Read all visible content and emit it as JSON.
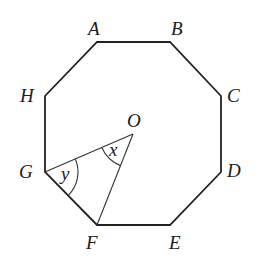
{
  "diagram": {
    "vertices": [
      {
        "name": "A",
        "label": "A",
        "x": 97,
        "y": 42,
        "lx": 88,
        "ly": 35
      },
      {
        "name": "B",
        "label": "B",
        "x": 170,
        "y": 42,
        "lx": 171,
        "ly": 35
      },
      {
        "name": "C",
        "label": "C",
        "x": 221,
        "y": 96,
        "lx": 227,
        "ly": 102
      },
      {
        "name": "D",
        "label": "D",
        "x": 221,
        "y": 172,
        "lx": 227,
        "ly": 177
      },
      {
        "name": "E",
        "label": "E",
        "x": 170,
        "y": 225,
        "lx": 169,
        "ly": 249
      },
      {
        "name": "F",
        "label": "F",
        "x": 97,
        "y": 225,
        "lx": 86,
        "ly": 249
      },
      {
        "name": "G",
        "label": "G",
        "x": 45,
        "y": 172,
        "lx": 19,
        "ly": 178
      },
      {
        "name": "H",
        "label": "H",
        "x": 45,
        "y": 96,
        "lx": 20,
        "ly": 102
      }
    ],
    "center": {
      "name": "O",
      "label": "O",
      "x": 133,
      "y": 134,
      "lx": 127,
      "ly": 127
    },
    "segments": [
      {
        "from": "G",
        "to": "O"
      },
      {
        "from": "O",
        "to": "F"
      }
    ],
    "angles": [
      {
        "name": "x",
        "label": "x",
        "vertex": "O",
        "between": [
          "G",
          "F"
        ],
        "lx": 109,
        "ly": 156
      },
      {
        "name": "y",
        "label": "y",
        "vertex": "G",
        "between": [
          "O",
          "F"
        ],
        "lx": 61,
        "ly": 180
      }
    ],
    "colors": {
      "stroke": "#222222",
      "background": "#ffffff"
    }
  }
}
